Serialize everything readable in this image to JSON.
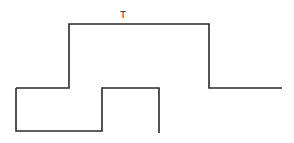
{
  "diagram": {
    "type": "timing-waveform",
    "label": "T",
    "stroke_color": "#2a2a2a",
    "background": "#ffffff",
    "waveforms": [
      {
        "name": "upper-pulse",
        "description": "high pulse of duration T",
        "points": [
          [
            16,
            88
          ],
          [
            69,
            88
          ],
          [
            69,
            24
          ],
          [
            209,
            24
          ],
          [
            209,
            88
          ],
          [
            282,
            88
          ]
        ]
      },
      {
        "name": "lower-pulse",
        "description": "stepped lower waveform",
        "points": [
          [
            16,
            88
          ],
          [
            16,
            131
          ],
          [
            102,
            131
          ],
          [
            102,
            88
          ],
          [
            159,
            88
          ],
          [
            159,
            133
          ]
        ]
      }
    ]
  }
}
